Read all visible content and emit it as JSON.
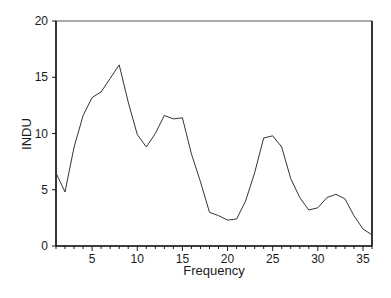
{
  "chart_data": {
    "type": "line",
    "title": "",
    "xlabel": "Frequency",
    "ylabel": "INDU",
    "xlim": [
      1,
      36
    ],
    "ylim": [
      0,
      20
    ],
    "grid": false,
    "legend": null,
    "x_ticks": [
      5,
      10,
      15,
      20,
      25,
      30,
      35
    ],
    "y_ticks": [
      0,
      5,
      10,
      15,
      20
    ],
    "x": [
      1,
      2,
      3,
      4,
      5,
      6,
      7,
      8,
      9,
      10,
      11,
      12,
      13,
      14,
      15,
      16,
      17,
      18,
      19,
      20,
      21,
      22,
      23,
      24,
      25,
      26,
      27,
      28,
      29,
      30,
      31,
      32,
      33,
      34,
      35,
      36
    ],
    "series": [
      {
        "name": "INDU",
        "values": [
          6.5,
          4.8,
          8.8,
          11.6,
          13.2,
          13.7,
          14.9,
          16.1,
          12.8,
          9.9,
          8.8,
          10.0,
          11.6,
          11.3,
          11.4,
          8.2,
          5.7,
          3.0,
          2.7,
          2.3,
          2.4,
          4.0,
          6.5,
          9.6,
          9.8,
          8.8,
          6.0,
          4.3,
          3.2,
          3.4,
          4.3,
          4.6,
          4.2,
          2.7,
          1.5,
          1.0
        ]
      }
    ]
  },
  "colors": {
    "line": "#333333",
    "axis": "#1a1a1a"
  }
}
